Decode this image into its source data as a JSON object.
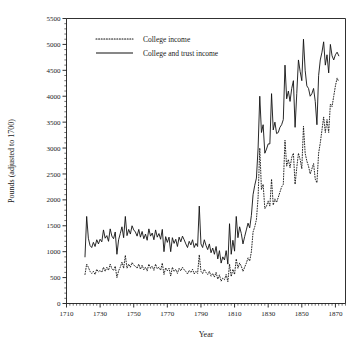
{
  "chart_data": {
    "type": "line",
    "title": "",
    "xlabel": "Year",
    "ylabel": "Pounds (adjusted to 1700)",
    "xlim": [
      1710,
      1876
    ],
    "ylim": [
      0,
      5500
    ],
    "x_tick_labels": [
      "1710",
      "1730",
      "1750",
      "1770",
      "1790",
      "1810",
      "1830",
      "1850",
      "1870"
    ],
    "x_tick_values": [
      1710,
      1730,
      1750,
      1770,
      1790,
      1810,
      1830,
      1850,
      1870
    ],
    "x_minor_step": 2,
    "y_tick_labels": [
      "0",
      "500",
      "1000",
      "1500",
      "2000",
      "2500",
      "3000",
      "3500",
      "4000",
      "4500",
      "5000",
      "5500"
    ],
    "y_tick_values": [
      0,
      500,
      1000,
      1500,
      2000,
      2500,
      3000,
      3500,
      4000,
      4500,
      5000,
      5500
    ],
    "y_minor_step": 100,
    "grid": false,
    "legend_position": "top-left",
    "legend_entries": [
      {
        "label": "College income",
        "style": "dotted"
      },
      {
        "label": "College and trust income",
        "style": "solid"
      }
    ],
    "x": [
      1721,
      1722,
      1723,
      1724,
      1725,
      1726,
      1727,
      1728,
      1729,
      1730,
      1731,
      1732,
      1733,
      1734,
      1735,
      1736,
      1737,
      1738,
      1739,
      1740,
      1741,
      1742,
      1743,
      1744,
      1745,
      1746,
      1747,
      1748,
      1749,
      1750,
      1751,
      1752,
      1753,
      1754,
      1755,
      1756,
      1757,
      1758,
      1759,
      1760,
      1761,
      1762,
      1763,
      1764,
      1765,
      1766,
      1767,
      1768,
      1769,
      1770,
      1771,
      1772,
      1773,
      1774,
      1775,
      1776,
      1777,
      1778,
      1779,
      1780,
      1781,
      1782,
      1783,
      1784,
      1785,
      1786,
      1787,
      1788,
      1789,
      1790,
      1791,
      1792,
      1793,
      1794,
      1795,
      1796,
      1797,
      1798,
      1799,
      1800,
      1801,
      1802,
      1803,
      1804,
      1805,
      1806,
      1807,
      1808,
      1809,
      1810,
      1811,
      1812,
      1813,
      1814,
      1815,
      1816,
      1817,
      1818,
      1819,
      1820,
      1821,
      1822,
      1823,
      1824,
      1825,
      1826,
      1827,
      1828,
      1829,
      1830,
      1831,
      1832,
      1833,
      1834,
      1835,
      1836,
      1837,
      1838,
      1839,
      1840,
      1841,
      1842,
      1843,
      1844,
      1845,
      1846,
      1847,
      1848,
      1849,
      1850,
      1851,
      1852,
      1853,
      1854,
      1855,
      1856,
      1857,
      1858,
      1859,
      1860,
      1861,
      1862,
      1863,
      1864,
      1865,
      1866,
      1867,
      1868,
      1869,
      1870,
      1871,
      1872
    ],
    "series": [
      {
        "name": "College and trust income",
        "style": "solid",
        "values": [
          900,
          1680,
          1260,
          1120,
          1080,
          1180,
          1100,
          1230,
          1150,
          1240,
          1190,
          1420,
          1260,
          1310,
          1200,
          1440,
          1300,
          1250,
          1380,
          950,
          1230,
          1350,
          1480,
          1270,
          1680,
          1310,
          1430,
          1340,
          1500,
          1420,
          1380,
          1300,
          1430,
          1280,
          1390,
          1250,
          1340,
          1220,
          1440,
          1300,
          1360,
          1230,
          1420,
          1280,
          1350,
          1240,
          1430,
          1000,
          1290,
          1180,
          1280,
          1000,
          1270,
          1160,
          1240,
          1100,
          1280,
          1190,
          1300,
          1230,
          1150,
          1080,
          1200,
          1130,
          1230,
          1080,
          1160,
          1100,
          1880,
          1150,
          1080,
          1230,
          1120,
          1040,
          1150,
          980,
          1070,
          950,
          1100,
          860,
          1020,
          780,
          900,
          840,
          1020,
          760,
          1540,
          950,
          1220,
          1010,
          1680,
          1270,
          1480,
          1350,
          1150,
          1290,
          1420,
          1550,
          1460,
          1700,
          2100,
          2280,
          2420,
          3000,
          4000,
          3300,
          3450,
          2900,
          2980,
          3080,
          3080,
          4050,
          3350,
          3500,
          3280,
          3300,
          3400,
          3450,
          3550,
          4600,
          3950,
          4100,
          3900,
          4150,
          4300,
          3400,
          4050,
          4700,
          4480,
          4300,
          5100,
          4500,
          4200,
          4150,
          4000,
          4050,
          4150,
          3900,
          3450,
          4400,
          4700,
          4850,
          5050,
          4600,
          4800,
          4450,
          5000,
          4780,
          4700,
          4800,
          4850,
          4780
        ]
      },
      {
        "name": "College income",
        "style": "dotted",
        "values": [
          560,
          760,
          700,
          620,
          580,
          620,
          560,
          660,
          610,
          640,
          600,
          700,
          620,
          700,
          640,
          760,
          670,
          640,
          720,
          500,
          630,
          700,
          800,
          680,
          930,
          680,
          760,
          700,
          790,
          740,
          720,
          680,
          760,
          660,
          740,
          650,
          700,
          630,
          760,
          680,
          720,
          640,
          760,
          670,
          700,
          640,
          780,
          560,
          690,
          630,
          680,
          530,
          700,
          620,
          660,
          580,
          680,
          630,
          700,
          650,
          620,
          570,
          640,
          600,
          660,
          570,
          620,
          580,
          940,
          620,
          580,
          660,
          600,
          560,
          620,
          530,
          580,
          510,
          600,
          470,
          550,
          430,
          490,
          460,
          560,
          420,
          760,
          520,
          660,
          560,
          860,
          680,
          780,
          720,
          620,
          700,
          780,
          880,
          820,
          1000,
          1380,
          1480,
          1620,
          2050,
          3000,
          2200,
          2300,
          1830,
          1880,
          1980,
          1880,
          2400,
          1900,
          2020,
          1950,
          2050,
          2150,
          2250,
          2300,
          3150,
          2650,
          2780,
          2620,
          2820,
          2900,
          2300,
          2620,
          2900,
          2780,
          2600,
          3420,
          2900,
          2750,
          2650,
          2500,
          2600,
          2700,
          2400,
          2330,
          2900,
          3100,
          3350,
          3600,
          3300,
          3550,
          3300,
          3850,
          3800,
          4000,
          4200,
          4350,
          4280
        ]
      }
    ]
  },
  "axes": {
    "y_axis_title": "Pounds (adjusted to 1700)",
    "x_axis_title": "Year"
  }
}
